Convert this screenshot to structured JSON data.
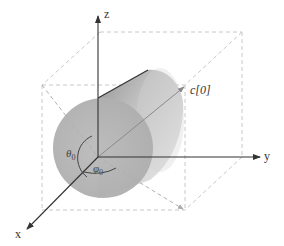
{
  "figure": {
    "axes": {
      "x": {
        "label": "x"
      },
      "y": {
        "label": "y"
      },
      "z": {
        "label": "z"
      }
    },
    "direction_vector": {
      "label": "c[0]"
    },
    "angles": {
      "theta": {
        "symbol": "θ",
        "subscript": "0"
      },
      "phi": {
        "symbol": "φ",
        "subscript": "0"
      }
    },
    "colors": {
      "axis": "#333333",
      "dashed_box": "#c8c8c8",
      "cylinder_body": "#bdbdbd",
      "cylinder_face": "#b5b5b5",
      "cylinder_highlight": "#d9d9d9",
      "vector": "#8a8a8a"
    }
  }
}
